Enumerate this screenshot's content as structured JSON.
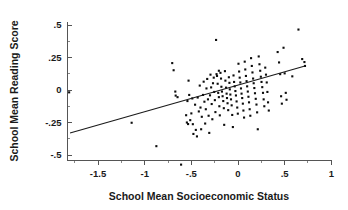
{
  "chart_data": {
    "type": "scatter",
    "title": "",
    "xlabel": "School Mean Socioeconomic Status",
    "ylabel": "School Mean Reading Score",
    "xlim": [
      -1.85,
      1.0
    ],
    "ylim": [
      -0.62,
      0.56
    ],
    "grid": false,
    "legend": null,
    "xticks": [
      -1.5,
      -1,
      -0.5,
      0,
      0.5,
      1
    ],
    "xticklabels": [
      "-1.5",
      "-1",
      "-.5",
      "0",
      ".5",
      "1"
    ],
    "yticks": [
      0.5,
      0.25,
      0,
      -0.25,
      -0.5
    ],
    "yticklabels": [
      ".5",
      ".25",
      "0",
      "-.25",
      "-.5"
    ],
    "x_minor_tick_step": 0.25,
    "marker": "square-dot",
    "marker_color": "#0d0d0d",
    "marker_size_px": 2.1,
    "fit_line": {
      "type": "linear-regression",
      "color": "#1a1a1a",
      "x_start": -1.8,
      "y_start": -0.331,
      "x_end": 0.718,
      "y_end": 0.185,
      "slope": 0.205,
      "intercept": 0.038
    },
    "n_points": 147,
    "points": [
      [
        -1.81,
        -0.018
      ],
      [
        -1.14,
        -0.252
      ],
      [
        -0.875,
        -0.432
      ],
      [
        -0.705,
        0.207
      ],
      [
        -0.69,
        0.152
      ],
      [
        -0.672,
        -0.012
      ],
      [
        -0.668,
        -0.043
      ],
      [
        -0.648,
        -0.055
      ],
      [
        -0.61,
        -0.574
      ],
      [
        -0.556,
        -0.194
      ],
      [
        -0.548,
        -0.25
      ],
      [
        -0.542,
        -0.085
      ],
      [
        -0.535,
        -0.262
      ],
      [
        -0.53,
        0.072
      ],
      [
        -0.523,
        -0.038
      ],
      [
        -0.512,
        -0.232
      ],
      [
        -0.5,
        -0.18
      ],
      [
        -0.49,
        -0.065
      ],
      [
        -0.484,
        -0.263
      ],
      [
        -0.478,
        -0.338
      ],
      [
        -0.46,
        -0.113
      ],
      [
        -0.452,
        -0.307
      ],
      [
        -0.44,
        -0.357
      ],
      [
        -0.432,
        -0.058
      ],
      [
        -0.42,
        -0.165
      ],
      [
        -0.41,
        0.034
      ],
      [
        -0.402,
        -0.135
      ],
      [
        -0.395,
        -0.302
      ],
      [
        -0.388,
        -0.206
      ],
      [
        -0.375,
        -0.038
      ],
      [
        -0.368,
        0.064
      ],
      [
        -0.36,
        -0.09
      ],
      [
        -0.352,
        -0.258
      ],
      [
        -0.345,
        -0.148
      ],
      [
        -0.338,
        0.012
      ],
      [
        -0.33,
        0.085
      ],
      [
        -0.322,
        -0.072
      ],
      [
        -0.315,
        -0.198
      ],
      [
        -0.308,
        -0.33
      ],
      [
        -0.3,
        -0.041
      ],
      [
        -0.295,
        0.118
      ],
      [
        -0.288,
        0.02
      ],
      [
        -0.282,
        -0.108
      ],
      [
        -0.275,
        -0.225
      ],
      [
        -0.268,
        0.052
      ],
      [
        -0.26,
        0.095
      ],
      [
        -0.255,
        -0.015
      ],
      [
        -0.248,
        -0.078
      ],
      [
        -0.242,
        -0.17
      ],
      [
        -0.235,
        0.385
      ],
      [
        -0.23,
        0.122
      ],
      [
        -0.225,
        0.108
      ],
      [
        -0.218,
        0.048
      ],
      [
        -0.212,
        -0.022
      ],
      [
        -0.205,
        -0.055
      ],
      [
        -0.2,
        -0.125
      ],
      [
        -0.195,
        -0.195
      ],
      [
        -0.188,
        0.132
      ],
      [
        -0.182,
        0.088
      ],
      [
        -0.178,
        0.025
      ],
      [
        -0.172,
        -0.012
      ],
      [
        -0.165,
        -0.048
      ],
      [
        -0.158,
        -0.085
      ],
      [
        -0.152,
        -0.14
      ],
      [
        -0.148,
        -0.268
      ],
      [
        -0.14,
        0.145
      ],
      [
        -0.135,
        0.072
      ],
      [
        -0.128,
        0.018
      ],
      [
        -0.122,
        -0.028
      ],
      [
        -0.118,
        -0.062
      ],
      [
        -0.112,
        -0.102
      ],
      [
        -0.105,
        -0.155
      ],
      [
        -0.098,
        0.098
      ],
      [
        -0.092,
        0.055
      ],
      [
        -0.088,
        0.005
      ],
      [
        -0.082,
        -0.035
      ],
      [
        -0.075,
        -0.072
      ],
      [
        -0.068,
        -0.118
      ],
      [
        -0.062,
        -0.192
      ],
      [
        -0.055,
        -0.285
      ],
      [
        -0.048,
        0.112
      ],
      [
        -0.042,
        0.062
      ],
      [
        -0.035,
        0.028
      ],
      [
        -0.028,
        -0.008
      ],
      [
        -0.022,
        -0.042
      ],
      [
        -0.015,
        -0.088
      ],
      [
        -0.008,
        -0.135
      ],
      [
        -0.002,
        -0.182
      ],
      [
        0.005,
        0.202
      ],
      [
        0.012,
        0.142
      ],
      [
        0.018,
        0.095
      ],
      [
        0.025,
        0.058
      ],
      [
        0.032,
        0.012
      ],
      [
        0.038,
        -0.028
      ],
      [
        0.045,
        -0.062
      ],
      [
        0.052,
        -0.105
      ],
      [
        0.058,
        -0.158
      ],
      [
        0.065,
        -0.212
      ],
      [
        0.072,
        0.218
      ],
      [
        0.078,
        0.158
      ],
      [
        0.085,
        0.108
      ],
      [
        0.092,
        0.068
      ],
      [
        0.098,
        0.028
      ],
      [
        0.105,
        -0.012
      ],
      [
        0.112,
        -0.052
      ],
      [
        0.118,
        -0.095
      ],
      [
        0.125,
        -0.148
      ],
      [
        0.132,
        -0.198
      ],
      [
        0.14,
        0.245
      ],
      [
        0.148,
        0.185
      ],
      [
        0.155,
        0.135
      ],
      [
        0.162,
        0.088
      ],
      [
        0.168,
        0.052
      ],
      [
        0.175,
        0.015
      ],
      [
        0.182,
        -0.025
      ],
      [
        0.19,
        -0.068
      ],
      [
        0.198,
        -0.112
      ],
      [
        0.205,
        -0.172
      ],
      [
        0.212,
        -0.302
      ],
      [
        0.222,
        0.258
      ],
      [
        0.23,
        0.198
      ],
      [
        0.238,
        0.148
      ],
      [
        0.245,
        0.102
      ],
      [
        0.252,
        0.062
      ],
      [
        0.26,
        0.022
      ],
      [
        0.268,
        -0.022
      ],
      [
        0.275,
        -0.072
      ],
      [
        0.282,
        -0.125
      ],
      [
        0.292,
        0.172
      ],
      [
        0.3,
        0.118
      ],
      [
        0.308,
        0.058
      ],
      [
        0.315,
        -0.015
      ],
      [
        0.322,
        -0.095
      ],
      [
        0.33,
        -0.158
      ],
      [
        0.425,
        0.292
      ],
      [
        0.44,
        0.212
      ],
      [
        0.452,
        0.122
      ],
      [
        0.462,
        -0.048
      ],
      [
        0.47,
        -0.105
      ],
      [
        0.488,
        0.325
      ],
      [
        0.5,
        0.128
      ],
      [
        0.512,
        -0.022
      ],
      [
        0.52,
        -0.075
      ],
      [
        0.582,
        0.105
      ],
      [
        0.648,
        0.465
      ],
      [
        0.688,
        0.238
      ],
      [
        0.712,
        0.215
      ],
      [
        0.718,
        0.185
      ],
      [
        -0.205,
        0.148
      ]
    ]
  }
}
